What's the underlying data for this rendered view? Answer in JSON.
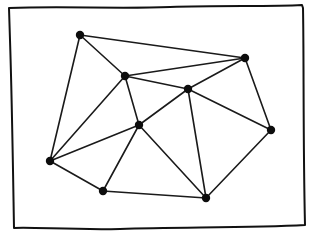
{
  "diagram": {
    "type": "planar-graph-triangulation",
    "frame": {
      "style": "hand-drawn rectangle",
      "stroke": "#111111"
    },
    "colors": {
      "edge": "#1a1a1a",
      "node": "#0d0d0d",
      "background": "#ffffff"
    },
    "nodes": [
      {
        "id": "A",
        "x": 80,
        "y": 35
      },
      {
        "id": "B",
        "x": 245,
        "y": 58
      },
      {
        "id": "C",
        "x": 125,
        "y": 76
      },
      {
        "id": "D",
        "x": 188,
        "y": 89
      },
      {
        "id": "E",
        "x": 271,
        "y": 130
      },
      {
        "id": "F",
        "x": 139,
        "y": 125
      },
      {
        "id": "G",
        "x": 50,
        "y": 161
      },
      {
        "id": "H",
        "x": 103,
        "y": 191
      },
      {
        "id": "I",
        "x": 206,
        "y": 198
      }
    ],
    "edges": [
      [
        "A",
        "B"
      ],
      [
        "A",
        "C"
      ],
      [
        "A",
        "G"
      ],
      [
        "C",
        "B"
      ],
      [
        "C",
        "D"
      ],
      [
        "C",
        "F"
      ],
      [
        "C",
        "G"
      ],
      [
        "D",
        "B"
      ],
      [
        "D",
        "F"
      ],
      [
        "D",
        "E"
      ],
      [
        "D",
        "I"
      ],
      [
        "B",
        "E"
      ],
      [
        "F",
        "G"
      ],
      [
        "F",
        "H"
      ],
      [
        "F",
        "I"
      ],
      [
        "G",
        "H"
      ],
      [
        "H",
        "I"
      ],
      [
        "I",
        "E"
      ]
    ]
  }
}
